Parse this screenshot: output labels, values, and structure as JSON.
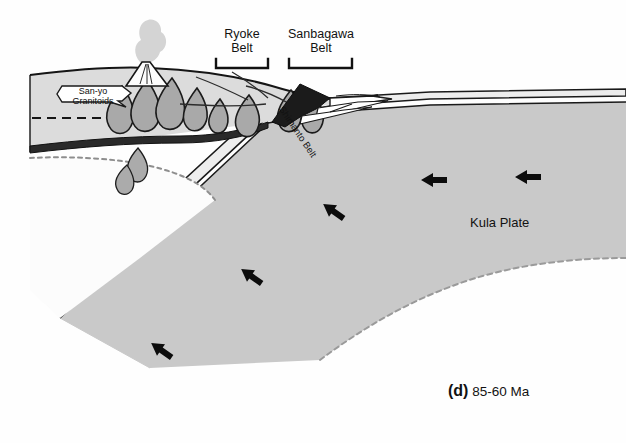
{
  "figure": {
    "caption_letter": "(d)",
    "caption_age": "85-60 Ma",
    "background_color": "#fefefe"
  },
  "labels": {
    "ryoke_belt_line1": "Ryoke",
    "ryoke_belt_line2": "Belt",
    "sanbagawa_belt_line1": "Sanbagawa",
    "sanbagawa_belt_line2": "Belt",
    "shimanto_belt": "Shimanto Belt",
    "kula_plate": "Kula Plate",
    "sanyo_line1": "San-yo",
    "sanyo_line2": "Granitoids"
  },
  "units": [
    {
      "name": "kula-plate-slab",
      "label": "Kula Plate",
      "color": "#c9c9c9"
    },
    {
      "name": "upper-plate-crust",
      "label": "Continental crust",
      "color": "#dddddd"
    },
    {
      "name": "asthenosphere-wedge",
      "label": "Asthenosphere",
      "color": "#fdfdfd"
    },
    {
      "name": "sanbagawa-high-p-wedge",
      "label": "Sanbagawa Belt",
      "color": "#1c1c1c"
    },
    {
      "name": "shimanto-accretionary-wedge",
      "label": "Shimanto Belt",
      "color": "#ffffff"
    },
    {
      "name": "granitoid-plutons",
      "label": "San-yo Granitoids",
      "color": "#a9a9a9"
    },
    {
      "name": "volcanic-plume",
      "label": "Volcanic plume",
      "color": "#d2d2d2"
    },
    {
      "name": "oceanic-crust-layer",
      "label": "Oceanic crust",
      "color": "#ebebeb"
    }
  ],
  "motion_arrows": [
    {
      "name": "arrow-convergence-far-right",
      "direction": "west",
      "x": 527,
      "y": 177
    },
    {
      "name": "arrow-convergence-right",
      "direction": "west",
      "x": 433,
      "y": 180
    },
    {
      "name": "arrow-slab-upper",
      "direction": "southwest",
      "x": 333,
      "y": 211
    },
    {
      "name": "arrow-slab-middle",
      "direction": "southwest",
      "x": 251,
      "y": 276
    },
    {
      "name": "arrow-slab-lower",
      "direction": "southwest",
      "x": 161,
      "y": 350
    }
  ],
  "brackets": [
    {
      "name": "bracket-ryoke",
      "x1": 215,
      "x2": 268,
      "y": 64
    },
    {
      "name": "bracket-sanbagawa",
      "x1": 288,
      "x2": 352,
      "y": 64
    }
  ]
}
